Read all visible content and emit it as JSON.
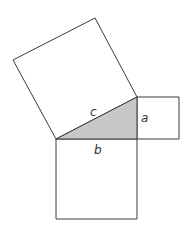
{
  "diagram": {
    "colors": {
      "stroke": "#3a3a3a",
      "triangle_fill": "#c8c8c8",
      "square_fill": "#ffffff",
      "label": "#333333"
    },
    "labels": {
      "hypotenuse": "c",
      "vertical_leg": "a",
      "horizontal_leg": "b"
    },
    "shapes": {
      "triangle": "56,139 137,97 137,139",
      "square_c": "56,139 137,97 95,18 13,60",
      "square_a": "137,97 179,97 179,139 137,139",
      "square_b": "56,139 137,139 137,219 56,219"
    }
  }
}
